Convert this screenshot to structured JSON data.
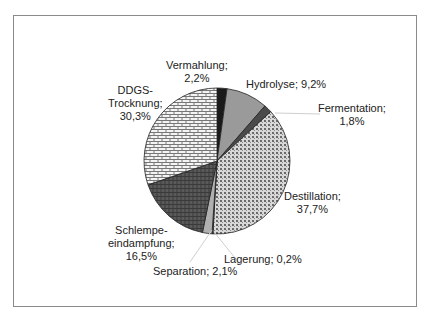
{
  "chart_data": {
    "type": "pie",
    "title": "",
    "categories": [
      "Vermahlung",
      "Hydrolyse",
      "Fermentation",
      "Destillation",
      "Lagerung",
      "Separation",
      "Schlempeeindampfung",
      "DDGS-Trocknung"
    ],
    "values": [
      2.2,
      9.2,
      1.8,
      37.7,
      0.2,
      2.1,
      16.5,
      30.3
    ],
    "unit": "%",
    "start_angle": "12 o'clock, clockwise",
    "legend": "none (data labels with leader lines)",
    "fills": [
      "#1a1a1a",
      "#9a9a9a",
      "#4a4a4a",
      "dotted-pattern",
      "#6a6a6a",
      "#b0b0b0",
      "dark-hatch-pattern",
      "brick-pattern"
    ]
  },
  "labels": {
    "vermahlung": [
      "Vermahlung;",
      "2,2%"
    ],
    "hydrolyse": [
      "Hydrolyse; 9,2%"
    ],
    "fermentation": [
      "Fermentation;",
      "1,8%"
    ],
    "destillation": [
      "Destillation;",
      "37,7%"
    ],
    "lagerung": [
      "Lagerung; 0,2%"
    ],
    "separation": [
      "Separation; 2,1%"
    ],
    "schlempe": [
      "Schlempe-",
      "eindampfung;",
      "16,5%"
    ],
    "ddgs": [
      "DDGS-",
      "Trocknung;",
      "30,3%"
    ]
  }
}
